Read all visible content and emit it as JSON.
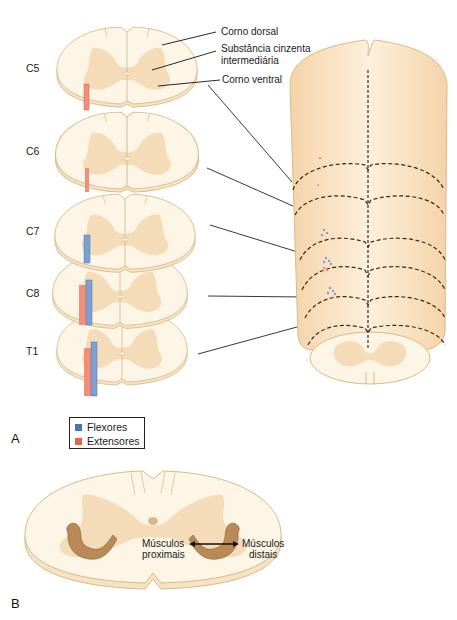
{
  "panel_a": {
    "label": "A",
    "segments": [
      {
        "name": "C5",
        "label": "C5"
      },
      {
        "name": "C6",
        "label": "C6"
      },
      {
        "name": "C7",
        "label": "C7"
      },
      {
        "name": "C8",
        "label": "C8"
      },
      {
        "name": "T1",
        "label": "T1"
      }
    ],
    "annotations": {
      "dorsal_horn": "Corno dorsal",
      "intermediate_line1": "Substância cinzenta",
      "intermediate_line2": "intermediária",
      "ventral_horn": "Corno ventral"
    },
    "legend": {
      "items": [
        {
          "label": "Flexores",
          "color": "#4a74b0"
        },
        {
          "label": "Extensores",
          "color": "#e8634a"
        }
      ]
    }
  },
  "panel_b": {
    "label": "B",
    "proximal_line1": "Músculos",
    "proximal_line2": "proximais",
    "distal_line1": "Músculos",
    "distal_line2": "distais"
  },
  "colors": {
    "white_matter": "#fdf6e6",
    "gray_matter": "#f5dcb8",
    "outline": "#d9b98a",
    "cord_body": "#f7ddb8",
    "flexor": "#7f9fd3",
    "extensor": "#f08e78"
  }
}
